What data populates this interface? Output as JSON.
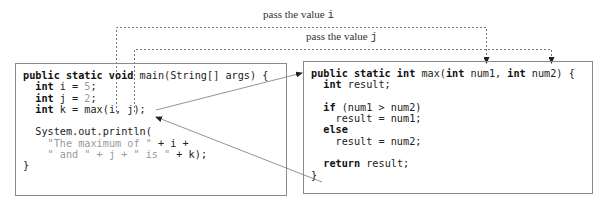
{
  "labels": {
    "pass_i_prefix": "pass the value ",
    "pass_i_var": "i",
    "pass_j_prefix": "pass the value ",
    "pass_j_var": "j"
  },
  "main_method": {
    "lines": [
      [
        {
          "t": "public static void",
          "c": "kw"
        },
        {
          "t": " main(String[] args) {",
          "c": ""
        }
      ],
      [
        {
          "t": "  ",
          "c": ""
        },
        {
          "t": "int",
          "c": "kw"
        },
        {
          "t": " i = ",
          "c": ""
        },
        {
          "t": "5",
          "c": "num"
        },
        {
          "t": ";",
          "c": ""
        }
      ],
      [
        {
          "t": "  ",
          "c": ""
        },
        {
          "t": "int",
          "c": "kw"
        },
        {
          "t": " j = ",
          "c": ""
        },
        {
          "t": "2",
          "c": "num"
        },
        {
          "t": ";",
          "c": ""
        }
      ],
      [
        {
          "t": "  ",
          "c": ""
        },
        {
          "t": "int",
          "c": "kw"
        },
        {
          "t": " k = max(i, j);",
          "c": ""
        }
      ],
      [
        {
          "t": "",
          "c": ""
        }
      ],
      [
        {
          "t": "  System.out.println(",
          "c": ""
        }
      ],
      [
        {
          "t": "    ",
          "c": ""
        },
        {
          "t": "\"The maximum of \"",
          "c": "str"
        },
        {
          "t": " + i +",
          "c": ""
        }
      ],
      [
        {
          "t": "    ",
          "c": ""
        },
        {
          "t": "\" and \" + j + \" is \"",
          "c": "str"
        },
        {
          "t": " + k);",
          "c": ""
        }
      ],
      [
        {
          "t": "}",
          "c": ""
        }
      ]
    ]
  },
  "max_method": {
    "lines": [
      [
        {
          "t": "public static int",
          "c": "kw"
        },
        {
          "t": " max(",
          "c": ""
        },
        {
          "t": "int",
          "c": "kw"
        },
        {
          "t": " num1, ",
          "c": ""
        },
        {
          "t": "int",
          "c": "kw"
        },
        {
          "t": " num2) {",
          "c": ""
        }
      ],
      [
        {
          "t": "  ",
          "c": ""
        },
        {
          "t": "int",
          "c": "kw"
        },
        {
          "t": " result;",
          "c": ""
        }
      ],
      [
        {
          "t": "",
          "c": ""
        }
      ],
      [
        {
          "t": "  ",
          "c": ""
        },
        {
          "t": "if",
          "c": "kw"
        },
        {
          "t": " (num1 > num2)",
          "c": ""
        }
      ],
      [
        {
          "t": "    result = num1;",
          "c": ""
        }
      ],
      [
        {
          "t": "  ",
          "c": ""
        },
        {
          "t": "else",
          "c": "kw"
        }
      ],
      [
        {
          "t": "    result = num2;",
          "c": ""
        }
      ],
      [
        {
          "t": "",
          "c": ""
        }
      ],
      [
        {
          "t": "  ",
          "c": ""
        },
        {
          "t": "return",
          "c": "kw"
        },
        {
          "t": " result;",
          "c": ""
        }
      ],
      [
        {
          "t": "}",
          "c": ""
        }
      ]
    ]
  },
  "colors": {
    "box_border": "#8a8a8a",
    "dashed_line": "#777777",
    "arrow_line": "#888888",
    "keyword": "#111111",
    "literal": "#9a9a9a"
  }
}
